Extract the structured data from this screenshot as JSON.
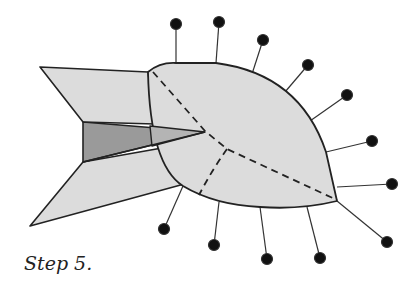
{
  "caption": "Step 5.",
  "colors": {
    "paper_fill": "#dcdcdc",
    "shaded_fill": "#9a9a9a",
    "outline": "#222222",
    "pin": "#111111"
  },
  "diagram": {
    "pin_count": 12
  }
}
